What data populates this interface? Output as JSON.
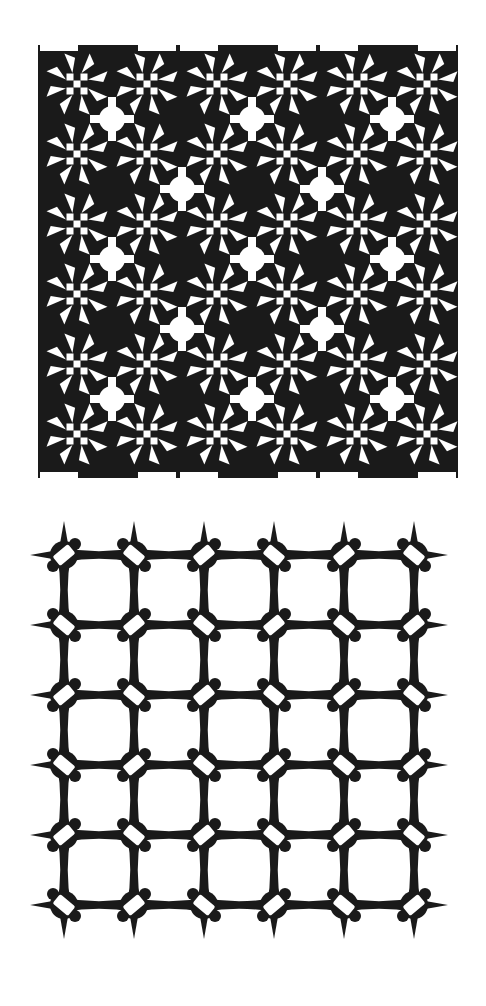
{
  "figures": [
    {
      "id": "pattern-a",
      "description": "Dense black-and-white geometric tiling of rosettes with checkerboard centers",
      "tile_cols": 3,
      "tile_rows": 3,
      "origin": [
        38,
        45
      ],
      "pitch": 140,
      "ink": "#1a1a1a",
      "paper": "#ffffff"
    },
    {
      "id": "pattern-b",
      "description": "Open lattice of four-pointed star nodes joined by concave curved links, each node with a white rectangular slot",
      "node_cols": 6,
      "node_rows": 6,
      "origin": [
        64,
        55
      ],
      "pitch": 70,
      "ink": "#1a1a1a",
      "paper": "#ffffff"
    }
  ]
}
